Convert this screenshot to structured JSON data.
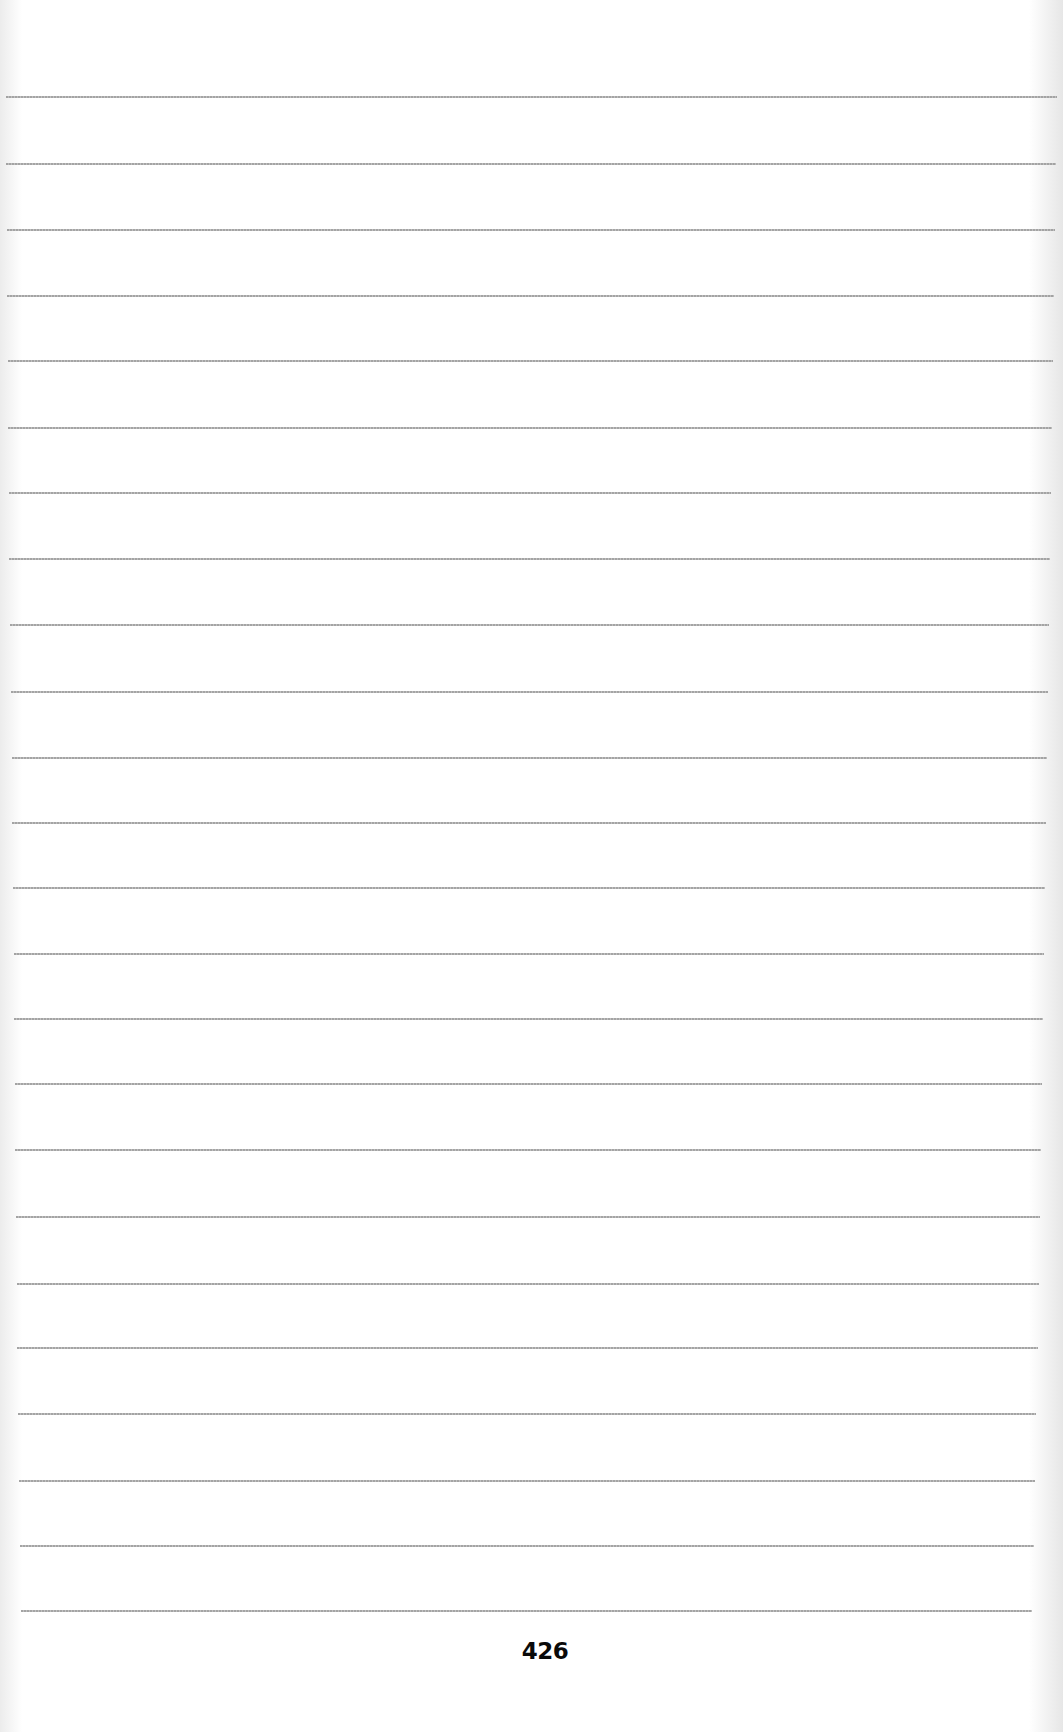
{
  "page": {
    "page_number": "426",
    "background_color": "#ffffff",
    "rule_color": "#9a9a9a",
    "rules": [
      {
        "y": 97,
        "x1": 6,
        "x2": 1057
      },
      {
        "y": 164,
        "x1": 6,
        "x2": 1056
      },
      {
        "y": 230,
        "x1": 7,
        "x2": 1055
      },
      {
        "y": 296,
        "x1": 7,
        "x2": 1054
      },
      {
        "y": 361,
        "x1": 8,
        "x2": 1053
      },
      {
        "y": 428,
        "x1": 8,
        "x2": 1052
      },
      {
        "y": 493,
        "x1": 9,
        "x2": 1051
      },
      {
        "y": 559,
        "x1": 9,
        "x2": 1050
      },
      {
        "y": 625,
        "x1": 10,
        "x2": 1049
      },
      {
        "y": 692,
        "x1": 11,
        "x2": 1048
      },
      {
        "y": 758,
        "x1": 12,
        "x2": 1047
      },
      {
        "y": 823,
        "x1": 12,
        "x2": 1046
      },
      {
        "y": 888,
        "x1": 13,
        "x2": 1045
      },
      {
        "y": 954,
        "x1": 14,
        "x2": 1044
      },
      {
        "y": 1019,
        "x1": 14,
        "x2": 1043
      },
      {
        "y": 1084,
        "x1": 15,
        "x2": 1042
      },
      {
        "y": 1150,
        "x1": 15,
        "x2": 1041
      },
      {
        "y": 1217,
        "x1": 16,
        "x2": 1040
      },
      {
        "y": 1284,
        "x1": 17,
        "x2": 1039
      },
      {
        "y": 1348,
        "x1": 17,
        "x2": 1038
      },
      {
        "y": 1414,
        "x1": 18,
        "x2": 1036
      },
      {
        "y": 1481,
        "x1": 19,
        "x2": 1035
      },
      {
        "y": 1546,
        "x1": 20,
        "x2": 1034
      },
      {
        "y": 1611,
        "x1": 21,
        "x2": 1032
      }
    ]
  }
}
